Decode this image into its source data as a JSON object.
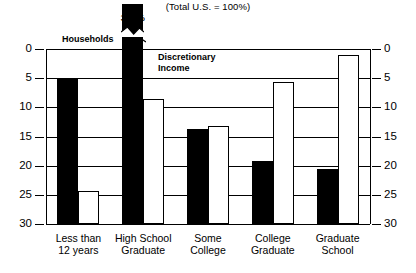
{
  "subtitle": "(Total U.S. = 100%)",
  "annotations": {
    "households_pointer": "Households",
    "discretionary_line1": "Discretionary",
    "discretionary_line2": "Income",
    "peak_value_label": "35.8%"
  },
  "axis": {
    "ticks": [
      "30",
      "25",
      "20",
      "15",
      "10",
      "5",
      "0"
    ],
    "left_labels": [
      "30",
      "25",
      "20",
      "15",
      "10",
      "5",
      "0"
    ],
    "right_labels": [
      "30",
      "25",
      "20",
      "15",
      "10",
      "5",
      "0"
    ]
  },
  "categories": [
    {
      "line1": "Less than",
      "line2": "12 years"
    },
    {
      "line1": "High School",
      "line2": "Graduate"
    },
    {
      "line1": "Some",
      "line2": "College"
    },
    {
      "line1": "College",
      "line2": "Graduate"
    },
    {
      "line1": "Graduate",
      "line2": "School"
    }
  ],
  "chart_data": {
    "type": "bar",
    "title": "",
    "subtitle": "(Total U.S. = 100%)",
    "xlabel": "",
    "ylabel": "",
    "ylim": [
      0,
      30
    ],
    "yticks": [
      0,
      5,
      10,
      15,
      20,
      25,
      30
    ],
    "grid": true,
    "legend_position": "inline-annotations",
    "axis_break": {
      "series": "Households",
      "category": "High School Graduate",
      "true_value": 35.8,
      "clipped_at": 30,
      "label": "35.8%",
      "marker": "zigzag"
    },
    "categories": [
      "Less than 12 years",
      "High School Graduate",
      "Some College",
      "College Graduate",
      "Graduate School"
    ],
    "series": [
      {
        "name": "Households",
        "style": "filled-black",
        "color": "#000000",
        "values": [
          25.0,
          35.8,
          16.3,
          10.8,
          9.5
        ]
      },
      {
        "name": "Discretionary Income",
        "style": "outlined-white",
        "color": "#ffffff",
        "values": [
          5.7,
          21.5,
          16.8,
          24.3,
          29.0
        ]
      }
    ]
  }
}
